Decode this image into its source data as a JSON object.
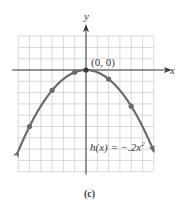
{
  "chart_data": {
    "type": "line",
    "title": "",
    "function_label": "h(x) = -.2x^2",
    "function_label_parts": {
      "lhs": "h(x) = −.2x",
      "exp": "2"
    },
    "xlabel": "x",
    "ylabel": "y",
    "caption": "(c)",
    "annotations": [
      {
        "text": "(0, 0)",
        "x": 0,
        "y": 0
      }
    ],
    "xlim": [
      -6,
      6
    ],
    "ylim": [
      -9,
      3
    ],
    "grid": true,
    "grid_step": 1,
    "coefficient": -0.2,
    "curve_domain": [
      -6,
      6
    ],
    "arrows_at_ends": true,
    "points": [
      {
        "x": -5,
        "y": -5
      },
      {
        "x": -3,
        "y": -1.8
      },
      {
        "x": -1,
        "y": -0.2
      },
      {
        "x": 0,
        "y": 0
      },
      {
        "x": 2,
        "y": -0.8
      },
      {
        "x": 4,
        "y": -3.2
      }
    ],
    "colors": {
      "curve": "#6b6b6b",
      "grid": "#cfcfcf",
      "axis": "#3a3a3a",
      "points": "#6b6b6b"
    }
  }
}
